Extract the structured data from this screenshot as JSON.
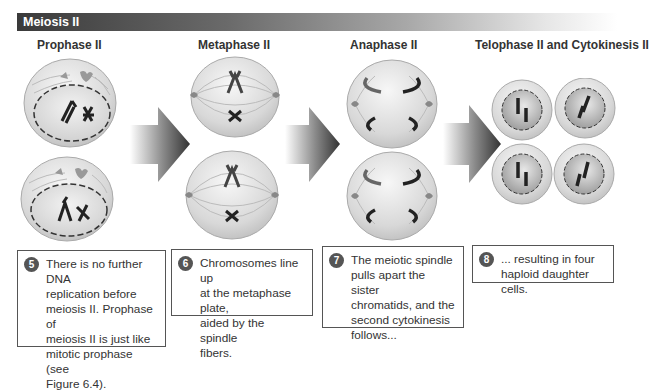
{
  "banner": {
    "title": "Meiosis II"
  },
  "phases": [
    {
      "title": "Prophase II",
      "step": "5",
      "description": "There is no further DNA\nreplication before\nmeiosis II. Prophase of\nmeiosis II is just like\nmitotic prophase (see\nFigure 6.4)."
    },
    {
      "title": "Metaphase II",
      "step": "6",
      "description": "Chromosomes line up\nat the metaphase plate,\naided by the spindle\nfibers."
    },
    {
      "title": "Anaphase II",
      "step": "7",
      "description": "The meiotic spindle\npulls apart the sister\nchromatids, and the\nsecond cytokinesis\nfollows..."
    },
    {
      "title": "Telophase II and Cytokinesis II",
      "step": "8",
      "description": "... resulting in four\nhaploid daughter cells."
    }
  ],
  "colors": {
    "banner_dark": "#3a3a3a",
    "cell_fill": "#dcdcdc",
    "chromosome": "#222222",
    "centrosome": "#888888",
    "arrow": "#555555"
  },
  "icons": [
    "right-arrow-icon"
  ]
}
